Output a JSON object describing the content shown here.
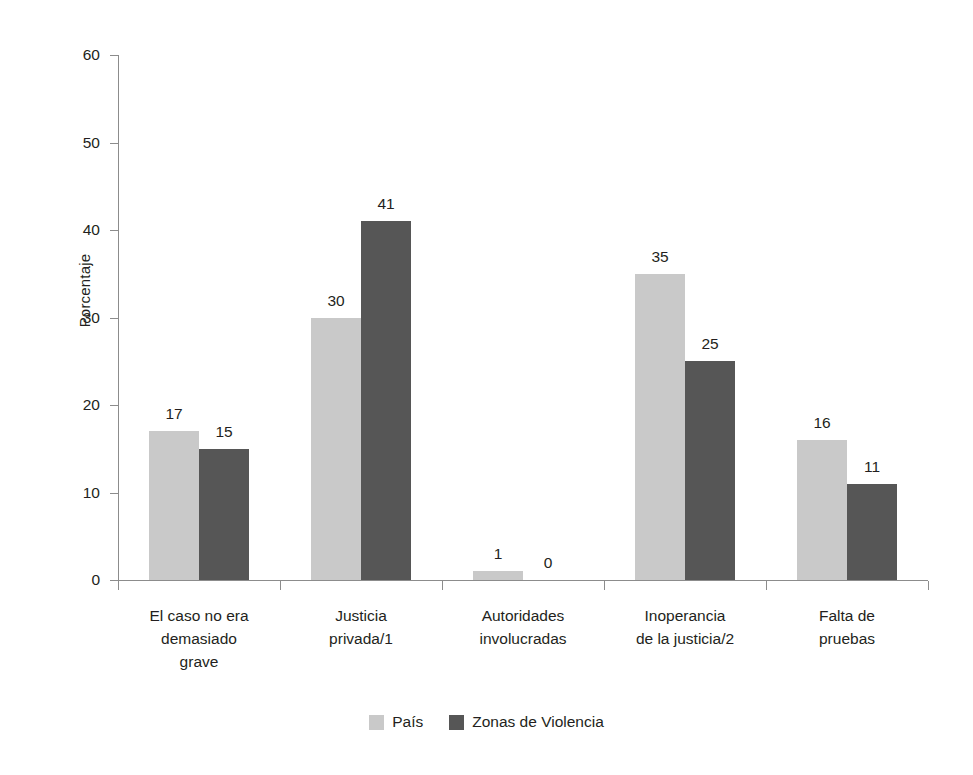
{
  "chart_data": {
    "type": "bar",
    "title": "",
    "subtitle": "",
    "xlabel": "",
    "ylabel": "Porcentaje",
    "ylim": [
      0,
      60
    ],
    "ytick_step": 10,
    "ytick_labels": [
      "60",
      "50",
      "40",
      "30",
      "20",
      "10",
      "0"
    ],
    "grid": false,
    "legend_position": "bottom-center",
    "categories": [
      "El caso no era demasiado grave",
      "Justicia privada/1",
      "Autoridades involucradas",
      "Inoperancia de la justicia/2",
      "Falta de pruebas"
    ],
    "category_lines": [
      [
        "El caso no era",
        "demasiado",
        "grave"
      ],
      [
        "Justicia",
        "privada/1"
      ],
      [
        "Autoridades",
        "involucradas"
      ],
      [
        "Inoperancia",
        "de la justicia/2"
      ],
      [
        "Falta de",
        "pruebas"
      ]
    ],
    "series": [
      {
        "name": "País",
        "color": "#c9c9c9",
        "values": [
          17,
          30,
          1,
          35,
          16
        ],
        "labels": [
          "17",
          "30",
          "1",
          "35",
          "16"
        ]
      },
      {
        "name": "Zonas de Violencia",
        "color": "#565656",
        "values": [
          15,
          41,
          0,
          25,
          11
        ],
        "labels": [
          "15",
          "41",
          "0",
          "25",
          "11"
        ]
      }
    ]
  },
  "legend": {
    "entries": [
      {
        "label": "País",
        "color": "#c9c9c9"
      },
      {
        "label": "Zonas de Violencia",
        "color": "#565656"
      }
    ]
  },
  "axis": {
    "y_title": "Porcentaje"
  }
}
